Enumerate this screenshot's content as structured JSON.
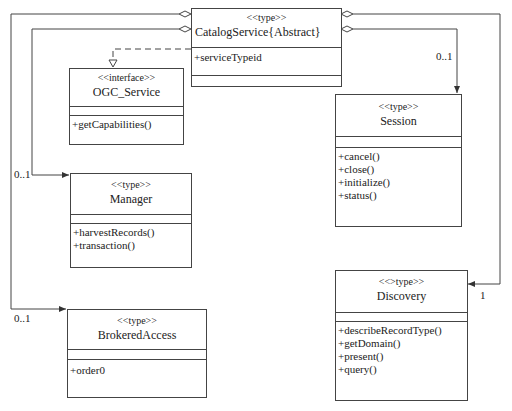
{
  "diagram": {
    "type": "UML class diagram",
    "classes": {
      "catalog": {
        "stereotype": "<<type>>",
        "name": "CatalogService{Abstract}",
        "attributes": [
          "+serviceTypeid"
        ],
        "operations": []
      },
      "ogc": {
        "stereotype": "<<interface>>",
        "name": "OGC_Service",
        "attributes": [],
        "operations": [
          "+getCapabilities()"
        ]
      },
      "session": {
        "stereotype": "<<type>>",
        "name": "Session",
        "attributes": [],
        "operations": [
          "+cancel()",
          "+close()",
          "+initialize()",
          "+status()"
        ]
      },
      "manager": {
        "stereotype": "<<type>>",
        "name": "Manager",
        "attributes": [],
        "operations": [
          "+harvestRecords()",
          "+transaction()"
        ]
      },
      "brokered": {
        "stereotype": "<<type>>",
        "name": "BrokeredAccess",
        "attributes": [],
        "operations": [
          "+order0"
        ]
      },
      "discovery": {
        "stereotype": "<<>type>>",
        "name": "Discovery",
        "attributes": [],
        "operations": [
          "+describeRecordType()",
          "+getDomain()",
          "+present()",
          "+query()"
        ]
      }
    },
    "multiplicities": {
      "session": "0..1",
      "manager": "0..1",
      "brokered": "0..1",
      "discovery": "1"
    },
    "relationships": [
      {
        "from": "CatalogService",
        "to": "OGC_Service",
        "kind": "realization"
      },
      {
        "from": "CatalogService",
        "to": "Session",
        "kind": "aggregation",
        "multiplicity": "0..1"
      },
      {
        "from": "CatalogService",
        "to": "Discovery",
        "kind": "aggregation",
        "multiplicity": "1"
      },
      {
        "from": "CatalogService",
        "to": "Manager",
        "kind": "aggregation",
        "multiplicity": "0..1"
      },
      {
        "from": "CatalogService",
        "to": "BrokeredAccess",
        "kind": "aggregation",
        "multiplicity": "0..1"
      }
    ]
  }
}
